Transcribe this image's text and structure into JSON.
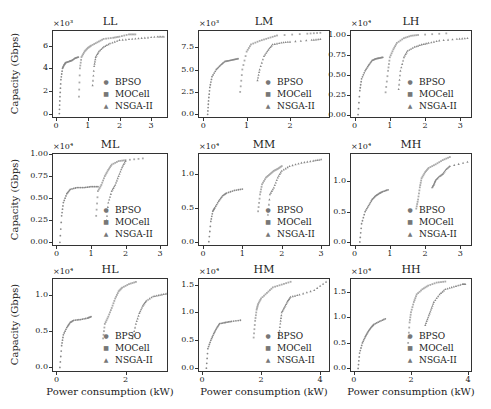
{
  "figure": {
    "ylabel": "Capacity (Gbps)",
    "xlabel": "Power consumption (kW)",
    "legend": [
      "BPSO",
      "MOCell",
      "NSGA-II"
    ],
    "marker_color": "#888888"
  },
  "chart_data": [
    {
      "type": "scatter",
      "title": "LL",
      "multiplier": "×10³",
      "xlabel": "",
      "ylabel": "Capacity (Gbps)",
      "xlim": [
        -0.1,
        3.5
      ],
      "ylim": [
        -0.3,
        7.3
      ],
      "xticks": [
        "0",
        "1",
        "2",
        "3"
      ],
      "yticks": [
        "0",
        "2",
        "4",
        "6"
      ],
      "ytick_values": [
        0,
        2,
        4,
        6
      ],
      "xtick_values": [
        0,
        1,
        2,
        3
      ],
      "series": [
        {
          "name": "BPSO",
          "x": [
            0.1,
            0.12,
            0.15,
            0.2,
            0.25,
            0.3,
            0.4,
            0.5,
            0.6,
            0.7
          ],
          "y": [
            0,
            1.5,
            3.0,
            4.0,
            4.3,
            4.5,
            4.6,
            4.7,
            4.9,
            5.0
          ]
        },
        {
          "name": "MOCell",
          "x": [
            0.72,
            0.75,
            0.8,
            0.9,
            1.0,
            1.1,
            1.3,
            1.5,
            1.8,
            2.0,
            2.3,
            2.5
          ],
          "y": [
            1.5,
            4.0,
            5.0,
            5.5,
            5.8,
            6.0,
            6.3,
            6.6,
            6.7,
            6.8,
            7.0,
            7.0
          ]
        },
        {
          "name": "NSGA-II",
          "x": [
            1.15,
            1.2,
            1.25,
            1.35,
            1.5,
            1.7,
            2.0,
            2.4,
            2.8,
            3.2,
            3.4
          ],
          "y": [
            2.5,
            4.2,
            5.0,
            5.5,
            5.9,
            6.2,
            6.5,
            6.6,
            6.7,
            6.8,
            6.8
          ]
        }
      ]
    },
    {
      "type": "scatter",
      "title": "LM",
      "multiplier": "×10³",
      "xlabel": "",
      "ylabel": "",
      "xlim": [
        -0.1,
        2.9
      ],
      "ylim": [
        -0.3,
        9.3
      ],
      "xticks": [
        "0",
        "1",
        "2"
      ],
      "yticks": [
        "0.0",
        "2.5",
        "5.0",
        "7.5"
      ],
      "ytick_values": [
        0,
        2.5,
        5.0,
        7.5
      ],
      "xtick_values": [
        0,
        1,
        2
      ],
      "series": [
        {
          "name": "BPSO",
          "x": [
            0.1,
            0.12,
            0.15,
            0.2,
            0.3,
            0.4,
            0.5,
            0.6,
            0.7,
            0.8
          ],
          "y": [
            0,
            1.5,
            3.0,
            4.2,
            5.0,
            5.5,
            5.9,
            6.0,
            6.1,
            6.2
          ]
        },
        {
          "name": "MOCell",
          "x": [
            0.85,
            0.9,
            1.0,
            1.1,
            1.3,
            1.5,
            1.7,
            2.4,
            2.7
          ],
          "y": [
            2.5,
            5.0,
            7.0,
            7.8,
            8.2,
            8.5,
            8.8,
            9.0,
            9.1
          ]
        },
        {
          "name": "NSGA-II",
          "x": [
            1.25,
            1.3,
            1.4,
            1.5,
            1.6,
            1.8,
            2.0,
            2.5,
            2.7
          ],
          "y": [
            3.8,
            5.0,
            6.5,
            7.2,
            7.8,
            8.0,
            8.1,
            8.3,
            8.4
          ]
        }
      ]
    },
    {
      "type": "scatter",
      "title": "LH",
      "multiplier": "×10⁴",
      "xlabel": "",
      "ylabel": "",
      "xlim": [
        -0.1,
        3.3
      ],
      "ylim": [
        -0.03,
        1.05
      ],
      "xticks": [
        "0",
        "1",
        "2",
        "3"
      ],
      "yticks": [
        "0.00",
        "0.25",
        "0.50",
        "0.75",
        "1.00"
      ],
      "ytick_values": [
        0,
        0.25,
        0.5,
        0.75,
        1.0
      ],
      "xtick_values": [
        0,
        1,
        2,
        3
      ],
      "series": [
        {
          "name": "BPSO",
          "x": [
            0.1,
            0.15,
            0.2,
            0.3,
            0.4,
            0.5,
            0.6,
            0.7,
            0.8
          ],
          "y": [
            0,
            0.3,
            0.45,
            0.55,
            0.62,
            0.68,
            0.7,
            0.71,
            0.72
          ]
        },
        {
          "name": "MOCell",
          "x": [
            0.88,
            0.95,
            1.0,
            1.1,
            1.2,
            1.4,
            1.6,
            1.8,
            2.6
          ],
          "y": [
            0.28,
            0.55,
            0.72,
            0.82,
            0.9,
            0.96,
            0.99,
            1.0,
            1.02
          ]
        },
        {
          "name": "NSGA-II",
          "x": [
            1.25,
            1.3,
            1.4,
            1.5,
            1.7,
            1.9,
            2.1,
            2.4,
            2.9,
            3.2
          ],
          "y": [
            0.32,
            0.55,
            0.72,
            0.8,
            0.85,
            0.88,
            0.9,
            0.93,
            0.95,
            0.96
          ]
        }
      ]
    },
    {
      "type": "scatter",
      "title": "ML",
      "multiplier": "×10⁴",
      "xlabel": "",
      "ylabel": "Capacity (Gbps)",
      "xlim": [
        -0.1,
        3.2
      ],
      "ylim": [
        -0.03,
        1.0
      ],
      "xticks": [
        "0",
        "1",
        "2",
        "3"
      ],
      "yticks": [
        "0.00",
        "0.25",
        "0.50",
        "0.75",
        "1.00"
      ],
      "ytick_values": [
        0,
        0.25,
        0.5,
        0.75,
        1.0
      ],
      "xtick_values": [
        0,
        1,
        2,
        3
      ],
      "series": [
        {
          "name": "BPSO",
          "x": [
            0.1,
            0.15,
            0.2,
            0.3,
            0.4,
            0.6,
            0.8,
            1.0,
            1.2
          ],
          "y": [
            0,
            0.3,
            0.45,
            0.55,
            0.6,
            0.62,
            0.62,
            0.63,
            0.63
          ]
        },
        {
          "name": "MOCell",
          "x": [
            1.15,
            1.2,
            1.3,
            1.4,
            1.5,
            1.6,
            1.8,
            2.0,
            2.5
          ],
          "y": [
            0.3,
            0.58,
            0.65,
            0.75,
            0.82,
            0.88,
            0.92,
            0.93,
            0.95
          ]
        },
        {
          "name": "NSGA-II",
          "x": [
            1.45,
            1.5,
            1.6,
            1.7,
            1.8,
            1.9,
            2.0
          ],
          "y": [
            0.25,
            0.45,
            0.58,
            0.65,
            0.75,
            0.85,
            0.92
          ]
        }
      ]
    },
    {
      "type": "scatter",
      "title": "MM",
      "multiplier": "×10⁴",
      "xlabel": "",
      "ylabel": "",
      "xlim": [
        -0.1,
        3.2
      ],
      "ylim": [
        -0.05,
        1.3
      ],
      "xticks": [
        "0",
        "1",
        "2",
        "3"
      ],
      "yticks": [
        "0.0",
        "0.5",
        "1.0"
      ],
      "ytick_values": [
        0,
        0.5,
        1.0
      ],
      "xtick_values": [
        0,
        1,
        2,
        3
      ],
      "series": [
        {
          "name": "BPSO",
          "x": [
            0.15,
            0.2,
            0.25,
            0.3,
            0.4,
            0.5,
            0.6,
            0.8,
            1.0
          ],
          "y": [
            0,
            0.3,
            0.45,
            0.5,
            0.6,
            0.68,
            0.72,
            0.76,
            0.78
          ]
        },
        {
          "name": "MOCell",
          "x": [
            1.4,
            1.45,
            1.5,
            1.6,
            1.7,
            1.8,
            1.9,
            2.0
          ],
          "y": [
            0.45,
            0.7,
            0.85,
            0.95,
            1.0,
            1.05,
            1.08,
            1.12
          ]
        },
        {
          "name": "NSGA-II",
          "x": [
            1.65,
            1.7,
            1.8,
            1.9,
            2.0,
            2.2,
            2.5,
            2.8,
            3.0
          ],
          "y": [
            0.4,
            0.7,
            0.8,
            0.95,
            1.05,
            1.12,
            1.17,
            1.2,
            1.22
          ]
        }
      ]
    },
    {
      "type": "scatter",
      "title": "MH",
      "multiplier": "×10⁴",
      "xlabel": "",
      "ylabel": "",
      "xlim": [
        -0.1,
        3.3
      ],
      "ylim": [
        -0.05,
        1.45
      ],
      "xticks": [
        "0",
        "1",
        "2",
        "3"
      ],
      "yticks": [
        "0.0",
        "0.5",
        "1.0"
      ],
      "ytick_values": [
        0,
        0.5,
        1.0
      ],
      "xtick_values": [
        0,
        1,
        2,
        3
      ],
      "series": [
        {
          "name": "BPSO",
          "x": [
            0.15,
            0.2,
            0.3,
            0.4,
            0.5,
            0.6,
            0.7,
            0.8,
            0.95
          ],
          "y": [
            0,
            0.3,
            0.5,
            0.6,
            0.7,
            0.76,
            0.8,
            0.83,
            0.86
          ]
        },
        {
          "name": "MOCell",
          "x": [
            1.75,
            1.8,
            1.85,
            1.9,
            2.0,
            2.1,
            2.3,
            2.5,
            2.7
          ],
          "y": [
            0.55,
            0.7,
            0.9,
            1.05,
            1.15,
            1.22,
            1.28,
            1.35,
            1.4
          ]
        },
        {
          "name": "NSGA-II",
          "x": [
            2.2,
            2.25,
            2.3,
            2.4,
            2.5,
            2.6,
            2.7,
            3.2
          ],
          "y": [
            0.9,
            0.95,
            1.02,
            1.08,
            1.12,
            1.2,
            1.25,
            1.32
          ]
        }
      ]
    },
    {
      "type": "scatter",
      "title": "HL",
      "multiplier": "×10⁴",
      "xlabel": "Power consumption (kW)",
      "ylabel": "Capacity (Gbps)",
      "xlim": [
        -0.1,
        3.2
      ],
      "ylim": [
        -0.05,
        1.22
      ],
      "xticks": [
        "0",
        "2"
      ],
      "yticks": [
        "0.0",
        "0.5",
        "1.0"
      ],
      "ytick_values": [
        0,
        0.5,
        1.0
      ],
      "xtick_values": [
        0,
        2
      ],
      "series": [
        {
          "name": "BPSO",
          "x": [
            0.1,
            0.15,
            0.2,
            0.3,
            0.4,
            0.5,
            0.7,
            0.9,
            1.0
          ],
          "y": [
            0,
            0.3,
            0.45,
            0.55,
            0.62,
            0.65,
            0.66,
            0.68,
            0.7
          ]
        },
        {
          "name": "MOCell",
          "x": [
            1.35,
            1.4,
            1.5,
            1.6,
            1.7,
            1.8,
            1.9,
            2.1,
            2.3
          ],
          "y": [
            0.4,
            0.6,
            0.7,
            0.82,
            0.95,
            1.05,
            1.1,
            1.15,
            1.18
          ]
        },
        {
          "name": "NSGA-II",
          "x": [
            2.2,
            2.3,
            2.4,
            2.5,
            2.6,
            2.8,
            3.0,
            3.2
          ],
          "y": [
            0.4,
            0.6,
            0.75,
            0.85,
            0.92,
            0.98,
            1.0,
            1.02
          ]
        }
      ]
    },
    {
      "type": "scatter",
      "title": "HM",
      "multiplier": "×10⁴",
      "xlabel": "Power consumption (kW)",
      "ylabel": "",
      "xlim": [
        -0.1,
        4.3
      ],
      "ylim": [
        -0.05,
        1.6
      ],
      "xticks": [
        "0",
        "2",
        "4"
      ],
      "yticks": [
        "0.0",
        "0.5",
        "1.0",
        "1.5"
      ],
      "ytick_values": [
        0,
        0.5,
        1.0,
        1.5
      ],
      "xtick_values": [
        0,
        2,
        4
      ],
      "series": [
        {
          "name": "BPSO",
          "x": [
            0.15,
            0.2,
            0.3,
            0.4,
            0.5,
            0.6,
            0.8,
            1.0,
            1.3
          ],
          "y": [
            0,
            0.35,
            0.5,
            0.62,
            0.72,
            0.8,
            0.82,
            0.84,
            0.86
          ]
        },
        {
          "name": "MOCell",
          "x": [
            1.75,
            1.8,
            1.85,
            1.9,
            2.0,
            2.2,
            2.4,
            2.7,
            3.0
          ],
          "y": [
            0.55,
            0.85,
            1.05,
            1.15,
            1.25,
            1.35,
            1.45,
            1.5,
            1.55
          ]
        },
        {
          "name": "NSGA-II",
          "x": [
            2.6,
            2.65,
            2.7,
            2.8,
            2.9,
            3.0,
            3.3,
            3.8,
            4.2
          ],
          "y": [
            0.55,
            0.8,
            1.0,
            1.1,
            1.2,
            1.28,
            1.32,
            1.4,
            1.55
          ]
        }
      ]
    },
    {
      "type": "scatter",
      "title": "HH",
      "multiplier": "×10⁴",
      "xlabel": "Power consumption (kW)",
      "ylabel": "",
      "xlim": [
        -0.1,
        4.1
      ],
      "ylim": [
        -0.05,
        1.75
      ],
      "xticks": [
        "0",
        "2",
        "4"
      ],
      "yticks": [
        "0.0",
        "0.5",
        "1.0",
        "1.5"
      ],
      "ytick_values": [
        0,
        0.5,
        1.0,
        1.5
      ],
      "xtick_values": [
        0,
        2,
        4
      ],
      "series": [
        {
          "name": "BPSO",
          "x": [
            0.15,
            0.2,
            0.3,
            0.4,
            0.5,
            0.6,
            0.7,
            0.9,
            1.1
          ],
          "y": [
            0,
            0.3,
            0.5,
            0.62,
            0.72,
            0.8,
            0.86,
            0.92,
            0.97
          ]
        },
        {
          "name": "MOCell",
          "x": [
            1.9,
            1.95,
            2.0,
            2.1,
            2.2,
            2.4,
            2.6,
            2.9,
            3.2
          ],
          "y": [
            0.5,
            0.9,
            1.1,
            1.3,
            1.45,
            1.55,
            1.62,
            1.68,
            1.7
          ]
        },
        {
          "name": "NSGA-II",
          "x": [
            2.5,
            2.6,
            2.7,
            2.8,
            3.0,
            3.2,
            3.5,
            3.8,
            3.9
          ],
          "y": [
            0.85,
            1.0,
            1.15,
            1.3,
            1.45,
            1.55,
            1.6,
            1.65,
            1.65
          ]
        }
      ]
    }
  ]
}
